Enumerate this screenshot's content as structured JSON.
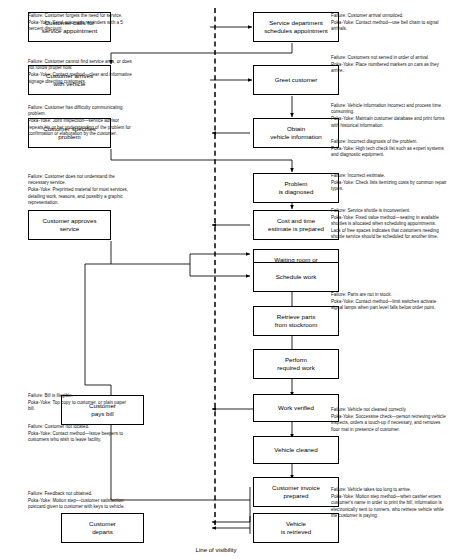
{
  "diagram": {
    "line_of_visibility_label": "Line of visibility",
    "colors": {
      "box_border": "#000000",
      "box_fill": "#ffffff",
      "connector": "#000000",
      "visibility_line": "#000000",
      "text": "#111111"
    }
  },
  "front_stage_boxes": [
    {
      "id": "customer-calls",
      "label": "Customer calls for\nservice appointment",
      "lines": [
        "Customer calls for",
        "service appointment"
      ]
    },
    {
      "id": "customer-arrives",
      "label": "Customer arrives\nwith vehicle",
      "lines": [
        "Customer arrives",
        "with vehicle"
      ]
    },
    {
      "id": "customer-specifies-problem",
      "label": "Customer specifies\nproblem",
      "lines": [
        "Customer specifies",
        "problem"
      ]
    },
    {
      "id": "customer-approves-service",
      "label": "Customer approves\nservice",
      "lines": [
        "Customer approves",
        "service"
      ]
    },
    {
      "id": "customer-pays-bill",
      "label": "Customer\npays bill",
      "lines": [
        "Customer",
        "pays bill"
      ]
    },
    {
      "id": "customer-departs",
      "label": "Customer\ndeparts",
      "lines": [
        "Customer",
        "departs"
      ]
    }
  ],
  "back_stage_boxes": [
    {
      "id": "service-department-schedules",
      "lines": [
        "Service department",
        "schedules appointment"
      ]
    },
    {
      "id": "greet-customer",
      "lines": [
        "Greet customer"
      ]
    },
    {
      "id": "obtain-vehicle-information",
      "lines": [
        "Obtain",
        "vehicle information"
      ]
    },
    {
      "id": "problem-is-diagnosed",
      "lines": [
        "Problem",
        "is diagnosed"
      ]
    },
    {
      "id": "cost-and-time-estimate",
      "lines": [
        "Cost and time",
        "estimate is prepared"
      ]
    },
    {
      "id": "waiting-room-or-shuttle",
      "lines": [
        "Waiting room or",
        "service shuttle provided"
      ]
    },
    {
      "id": "schedule-work",
      "lines": [
        "Schedule work"
      ]
    },
    {
      "id": "retrieve-parts",
      "lines": [
        "Retrieve parts",
        "from stockroom"
      ]
    },
    {
      "id": "perform-required-work",
      "lines": [
        "Perform",
        "required work"
      ]
    },
    {
      "id": "work-verified",
      "lines": [
        "Work verified"
      ]
    },
    {
      "id": "vehicle-cleaned",
      "lines": [
        "Vehicle cleaned"
      ]
    },
    {
      "id": "customer-invoice-prepared",
      "lines": [
        "Customer invoice",
        "prepared"
      ]
    },
    {
      "id": "vehicle-is-retrieved",
      "lines": [
        "Vehicle",
        "is retrieved"
      ]
    }
  ],
  "left_notes": [
    {
      "id": "note-forgets-need",
      "failure": "Failure: Customer forgets the need for service.",
      "poka_yoke": "Poka-Yoke: Send automatic reminders with a 5 percent discount."
    },
    {
      "id": "note-cannot-find-service-area",
      "failure": "Failure: Customer cannot find service area, or does not follow proper flow.",
      "poka_yoke": "Poka-Yoke: Contact method—clear and informative signage directing customers."
    },
    {
      "id": "note-difficulty-communicating",
      "failure": "Failure: Customer has difficulty communicating problem.",
      "poka_yoke": "Poka-Yoke: Joint inspection—service advisor repeats his or her understanding of the problem for confirmation or elaboration by the customer."
    },
    {
      "id": "note-does-not-understand-service",
      "failure": "Failure: Customer does not understand the necessary service.",
      "poka_yoke": "Poka-Yoke: Preprinted material for most services, detailing work, reasons, and possibly a graphic representation."
    },
    {
      "id": "note-bill-illegible",
      "failure": "Failure: Bill is illegible.",
      "poka_yoke": "Poka-Yoke: Top copy to customer, or plain paper bill."
    },
    {
      "id": "note-customer-not-located",
      "failure": "Failure: Customer not located.",
      "poka_yoke": "Poka-Yoke: Contact method—Issue beepers to customers who wish to leave facility."
    },
    {
      "id": "note-feedback-not-obtained",
      "failure": "Failure: Feedback not obtained.",
      "poka_yoke": "Poka-Yoke: Motion step—customer satisfaction postcard given to customer with keys to vehicle."
    }
  ],
  "right_notes": [
    {
      "id": "note-arrival-unnoticed",
      "failure": "Failure: Customer arrival unnoticed.",
      "poka_yoke": "Poka-Yoke: Contact method—use bell chain to signal arrivals."
    },
    {
      "id": "note-not-served-in-order",
      "failure": "Failure: Customers not served in order of arrival.",
      "poka_yoke": "Poka-Yoke: Place numbered markers on cars as they arrive."
    },
    {
      "id": "note-vehicle-information-incorrect",
      "failure": "Failure: Vehicle information incorrect and process time consuming.",
      "poka_yoke": "Poka-Yoke: Maintain customer database and print forms with historical information."
    },
    {
      "id": "note-incorrect-diagnosis",
      "failure": "Failure: Incorrect diagnosis of the problem.",
      "poka_yoke": "Poka-Yoke: High tech check list such as expert systems and diagnostic equipment."
    },
    {
      "id": "note-incorrect-estimate",
      "failure": "Failure: Incorrect estimate.",
      "poka_yoke": "Poka-Yoke: Check lists itemizing costs by common repair types."
    },
    {
      "id": "note-shuttle-inconvenient",
      "failure": "Failure: Service shuttle is inconvenient.",
      "poka_yoke": "Poka-Yoke: Fixed value method—seating in available shuttles is allocated when scheduling appointments. Lack of free spaces indicates that customers needing shuttle service should be scheduled for another time."
    },
    {
      "id": "note-parts-not-in-stock",
      "failure": "Failure: Parts are not in stock.",
      "poka_yoke": "Poka-Yoke: Contact method—limit switches activate signal lamps when part level falls below order point."
    },
    {
      "id": "note-vehicle-not-cleaned",
      "failure": "Failure: Vehicle not cleaned correctly.",
      "poka_yoke": "Poka-Yoke: Successive check—person retrieving vehicle inspects, orders a touch-up if necessary, and removes floor mat in presence of customer."
    },
    {
      "id": "note-vehicle-takes-too-long",
      "failure": "Failure: Vehicle takes too long to arrive.",
      "poka_yoke": "Poka-Yoke: Motion step method—when cashier enters customer's name in order to print the bill, information is electronically sent to runners, who retrieve vehicle while the customer is paying."
    }
  ]
}
